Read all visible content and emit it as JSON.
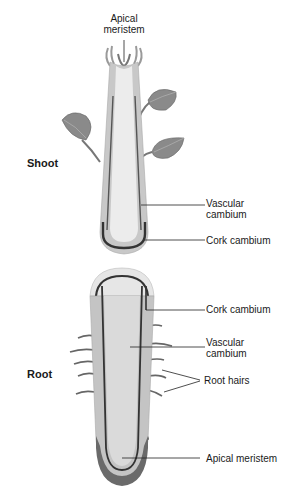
{
  "diagram": {
    "type": "plant-meristem-cross-section",
    "sections": {
      "shoot": {
        "label": "Shoot"
      },
      "root": {
        "label": "Root"
      }
    },
    "labels": {
      "shoot_apical_line1": "Apical",
      "shoot_apical_line2": "meristem",
      "shoot_vascular_line1": "Vascular",
      "shoot_vascular_line2": "cambium",
      "shoot_cork": "Cork cambium",
      "root_cork": "Cork cambium",
      "root_vascular_line1": "Vascular",
      "root_vascular_line2": "cambium",
      "root_hairs": "Root hairs",
      "root_apical": "Apical meristem"
    },
    "colors": {
      "outer_tissue": "#c4c4c4",
      "inner_tissue": "#e8e8e8",
      "cambium_dark": "#3a3a3a",
      "root_cap": "#6a6a6a",
      "leaf": "#8a8a8a",
      "leader_line": "#222222"
    }
  }
}
